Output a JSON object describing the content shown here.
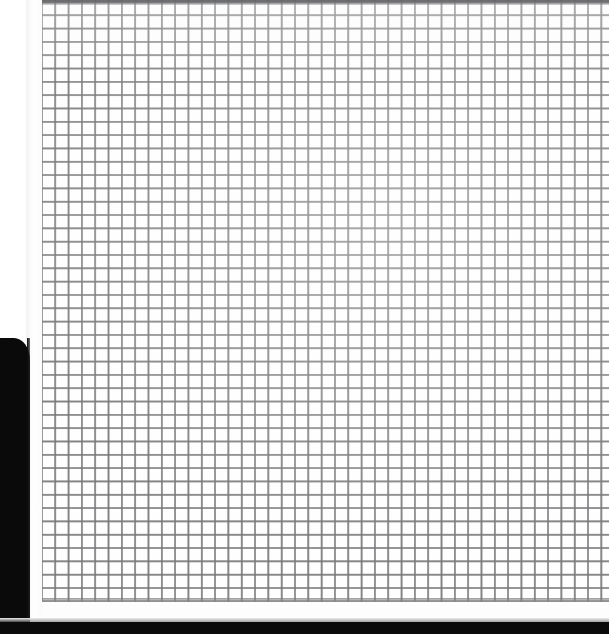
{
  "scene": {
    "title": "Window screen mesh close-up",
    "subject": "insect screen / wire mesh",
    "width_px": 609,
    "height_px": 634,
    "description": "Extreme close-up photograph of a square-weave window screen mesh filling most of the frame, bounded on the left by a white window frame strip and a black shadowed area, with a black band across the bottom."
  },
  "colors": {
    "mesh_line": "#78787a",
    "mesh_cell": "#fefefe",
    "frame_white": "#ffffff",
    "shadow_black": "#0a0a0a",
    "top_rail_gray": "#5a5a5d"
  },
  "geometry": {
    "mesh_left_px": 40,
    "mesh_top_px": 0,
    "mesh_right_px": 609,
    "mesh_bottom_px": 602,
    "cell_pitch_px": 13.32,
    "line_width_px": 2,
    "columns": 43,
    "rows": 45
  },
  "regions": {
    "mesh_label": "wire mesh screen",
    "top_rail_label": "top frame rail",
    "frame_strip_label": "white frame edge",
    "dark_block_label": "shadowed left area",
    "bottom_band_label": "shadowed bottom edge",
    "corner_label": "white upper-left corner"
  }
}
